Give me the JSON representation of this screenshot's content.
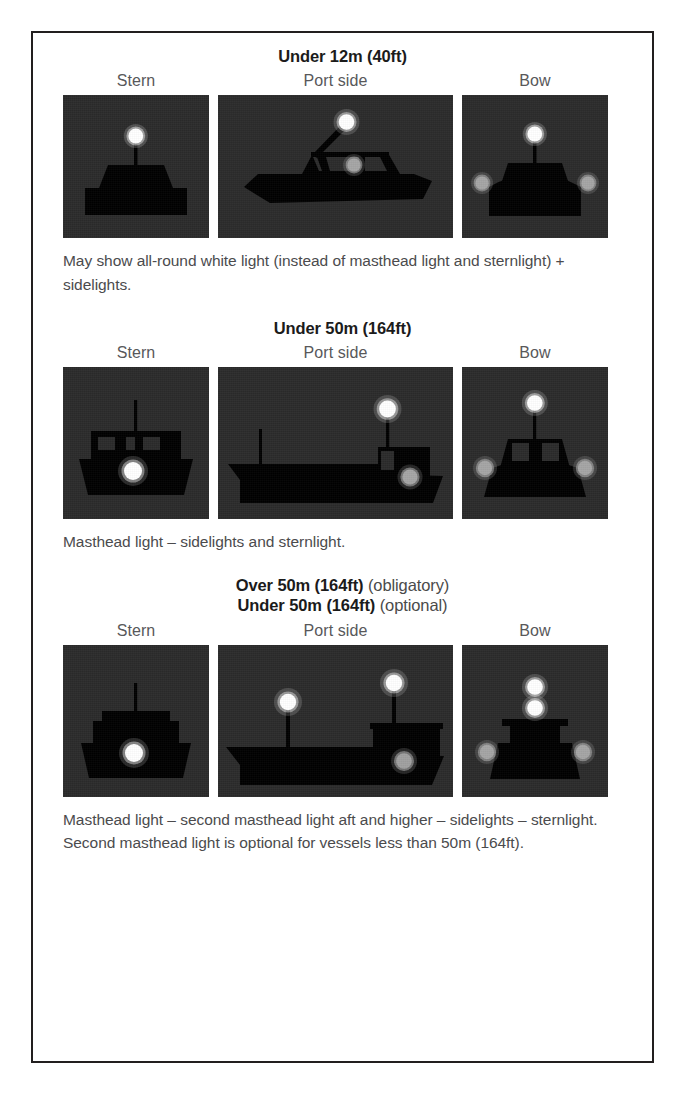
{
  "figure": {
    "topic": "Navigation lights for power-driven vessels underway",
    "view_labels": {
      "stern": "Stern",
      "port": "Port side",
      "bow": "Bow"
    },
    "colors": {
      "panel_background": "#2b2b2b",
      "vessel_silhouette": "#000000",
      "masthead_light": "#ffffff",
      "sternlight": "#ffffff",
      "sidelight": "#a9a9a9",
      "border": "#221f1f",
      "caption_text": "#4b4b4d",
      "heading_text": "#1b1b1b"
    },
    "sections": [
      {
        "id": "under-12m",
        "heading_lines": [
          {
            "bold": "Under 12m (40ft)",
            "regular": ""
          }
        ],
        "caption": "May show all-round white light (instead of masthead light and sternlight) + sidelights.",
        "views": {
          "stern": {
            "vessel": "small-motorboat-stern",
            "lights": [
              "all-round white light on mast"
            ]
          },
          "port": {
            "vessel": "speedboat-port-profile",
            "lights": [
              "all-round white light on raked mast",
              "red port sidelight"
            ]
          },
          "bow": {
            "vessel": "small-motorboat-bow",
            "lights": [
              "all-round white light on mast",
              "red port sidelight",
              "green starboard sidelight"
            ]
          }
        }
      },
      {
        "id": "under-50m",
        "heading_lines": [
          {
            "bold": "Under 50m (164ft)",
            "regular": ""
          }
        ],
        "caption": "Masthead light – sidelights and sternlight.",
        "views": {
          "stern": {
            "vessel": "ship-stern-with-windows",
            "lights": [
              "white sternlight"
            ]
          },
          "port": {
            "vessel": "cargo-ship-port-profile",
            "lights": [
              "masthead light",
              "red port sidelight"
            ]
          },
          "bow": {
            "vessel": "ship-bow",
            "lights": [
              "masthead light",
              "red port sidelight",
              "green starboard sidelight"
            ]
          }
        }
      },
      {
        "id": "over-50m",
        "heading_lines": [
          {
            "bold": "Over 50m (164ft)",
            "regular": " (obligatory)"
          },
          {
            "bold": "Under 50m (164ft)",
            "regular": " (optional)"
          }
        ],
        "caption": "Masthead light – second masthead light aft and higher – sidelights – sternlight. Second masthead light is optional for vessels less than 50m (164ft).",
        "views": {
          "stern": {
            "vessel": "ship-stern-with-mast",
            "lights": [
              "white sternlight"
            ]
          },
          "port": {
            "vessel": "cargo-ship-port-profile-two-masts",
            "lights": [
              "forward masthead light (lower)",
              "aft masthead light (higher)",
              "red port sidelight"
            ]
          },
          "bow": {
            "vessel": "ship-bow-two-masthead",
            "lights": [
              "upper masthead light",
              "lower masthead light",
              "red port sidelight",
              "green starboard sidelight"
            ]
          }
        }
      }
    ]
  }
}
